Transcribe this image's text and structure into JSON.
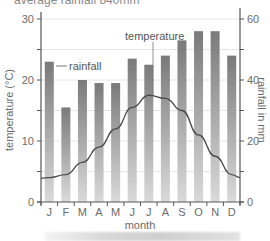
{
  "caption": "average rainfall 840mm",
  "chart_data": {
    "type": "bar",
    "title": "",
    "caption": "average rainfall 840mm",
    "categories": [
      "J",
      "F",
      "M",
      "A",
      "M",
      "J",
      "J",
      "A",
      "S",
      "O",
      "N",
      "D"
    ],
    "series": [
      {
        "name": "rainfall",
        "type": "bar",
        "axis": "right",
        "unit": "mm",
        "values": [
          46,
          31,
          40,
          39,
          39,
          47,
          45,
          48,
          53,
          56,
          56,
          48
        ]
      },
      {
        "name": "temperature",
        "type": "line",
        "axis": "left",
        "unit": "°C",
        "values": [
          4,
          4.5,
          6.5,
          9,
          12,
          15.5,
          17.5,
          17,
          15,
          11,
          7.5,
          4.5
        ]
      }
    ],
    "xlabel": "month",
    "ylabel": "temperature (°C)",
    "ylabel_right": "rainfall in mm",
    "ylim": [
      0,
      30
    ],
    "ylim_right": [
      0,
      60
    ],
    "yticks": [
      0,
      10,
      20,
      30
    ],
    "yticks_right": [
      0,
      20,
      40,
      60
    ],
    "grid": true,
    "annotations": [
      "rainfall",
      "temperature"
    ],
    "colors": {
      "bar_top": "#7a7a7a",
      "bar_bottom": "#d6d6d6",
      "line": "#4a4a4a",
      "grid": "#e6e6e6",
      "axis": "#555555"
    }
  },
  "labels": {
    "xlabel": "month",
    "ylabel": "temperature (°C)",
    "ylabel_right": "rainfall in mm",
    "rainfall_annot": "rainfall",
    "temperature_annot": "temperature",
    "yticks": [
      "0",
      "10",
      "20",
      "30"
    ],
    "yticks_right": [
      "0",
      "20",
      "40",
      "60"
    ],
    "months": [
      "J",
      "F",
      "M",
      "A",
      "M",
      "J",
      "J",
      "A",
      "S",
      "O",
      "N",
      "D"
    ]
  }
}
